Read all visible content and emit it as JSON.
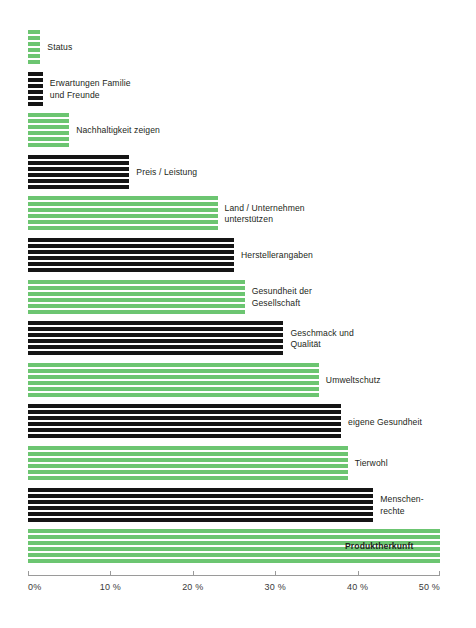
{
  "chart_data": {
    "type": "bar",
    "orientation": "horizontal",
    "title": "",
    "xlabel": "",
    "ylabel": "",
    "xlim": [
      0,
      50
    ],
    "grid": false,
    "legend": false,
    "unit": "%",
    "xticks": [
      0,
      10,
      20,
      30,
      40,
      50
    ],
    "xticklabels": [
      "0%",
      "10 %",
      "20 %",
      "30 %",
      "40 %",
      "50 %"
    ],
    "colors": {
      "green": "#6cc571",
      "black": "#151515",
      "axis": "#9a9a9a",
      "text": "#231f20",
      "background": "#ffffff"
    },
    "categories": [
      "Status",
      "Erwartungen Familie und Freunde",
      "Nachhaltigkeit zeigen",
      "Preis / Leistung",
      "Land / Unternehmen unterstützen",
      "Herstellerangaben",
      "Gesundheit der Gesellschaft",
      "Geschmack und Qualität",
      "Umweltschutz",
      "eigene Gesundheit",
      "Tierwohl",
      "Menschenrechte",
      "Produktherkunft"
    ],
    "values": [
      1.5,
      1.8,
      5,
      12.3,
      23,
      25,
      26.3,
      31,
      35.3,
      38,
      38.8,
      41.9,
      50
    ],
    "bars": [
      {
        "label": "Status",
        "label_lines": [
          "Status"
        ],
        "value": 1.5,
        "color": "green",
        "label_inside": false
      },
      {
        "label": "Erwartungen Familie und Freunde",
        "label_lines": [
          "Erwartungen Familie",
          "und Freunde"
        ],
        "value": 1.8,
        "color": "black",
        "label_inside": false
      },
      {
        "label": "Nachhaltigkeit zeigen",
        "label_lines": [
          "Nachhaltigkeit zeigen"
        ],
        "value": 5,
        "color": "green",
        "label_inside": false
      },
      {
        "label": "Preis / Leistung",
        "label_lines": [
          "Preis / Leistung"
        ],
        "value": 12.3,
        "color": "black",
        "label_inside": false
      },
      {
        "label": "Land / Unternehmen unterstützen",
        "label_lines": [
          "Land / Unternehmen",
          "unterstützen"
        ],
        "value": 23,
        "color": "green",
        "label_inside": false
      },
      {
        "label": "Herstellerangaben",
        "label_lines": [
          "Herstellerangaben"
        ],
        "value": 25,
        "color": "black",
        "label_inside": false
      },
      {
        "label": "Gesundheit der Gesellschaft",
        "label_lines": [
          "Gesundheit der",
          "Gesellschaft"
        ],
        "value": 26.3,
        "color": "green",
        "label_inside": false
      },
      {
        "label": "Geschmack und Qualität",
        "label_lines": [
          "Geschmack und",
          "Qualität"
        ],
        "value": 31,
        "color": "black",
        "label_inside": false
      },
      {
        "label": "Umweltschutz",
        "label_lines": [
          "Umweltschutz"
        ],
        "value": 35.3,
        "color": "green",
        "label_inside": false
      },
      {
        "label": "eigene Gesundheit",
        "label_lines": [
          "eigene Gesundheit"
        ],
        "value": 38,
        "color": "black",
        "label_inside": false
      },
      {
        "label": "Tierwohl",
        "label_lines": [
          "Tierwohl"
        ],
        "value": 38.8,
        "color": "green",
        "label_inside": false
      },
      {
        "label": "Menschenrechte",
        "label_lines": [
          "Menschen-",
          "rechte"
        ],
        "value": 41.9,
        "color": "black",
        "label_inside": false
      },
      {
        "label": "Produktherkunft",
        "label_lines": [
          "Produktherkunft"
        ],
        "value": 50,
        "color": "green",
        "label_inside": true
      }
    ]
  }
}
